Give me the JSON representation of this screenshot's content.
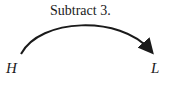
{
  "diagram": {
    "operation_label": "Subtract 3.",
    "from_node": "H",
    "to_node": "L",
    "arrow": {
      "direction": "from-to",
      "shape": "arc",
      "color": "#1a1a1a"
    }
  }
}
